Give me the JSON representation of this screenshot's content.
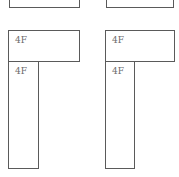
{
  "panels": [
    {
      "top_box": {
        "label": ""
      },
      "floor_box": {
        "label": "4F"
      },
      "column_box": {
        "label": "4F"
      }
    },
    {
      "top_box": {
        "label": ""
      },
      "floor_box": {
        "label": "4F"
      },
      "column_box": {
        "label": "4F"
      }
    }
  ],
  "colors": {
    "stroke": "#5a5a5a",
    "label": "#6a6a6a",
    "background": "#ffffff"
  }
}
